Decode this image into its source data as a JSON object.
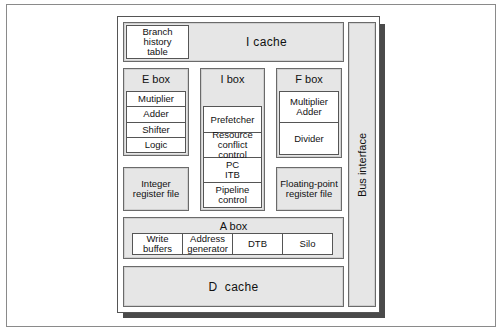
{
  "diagram": {
    "i_cache": {
      "label": "I cache",
      "branch_history_table": "Branch\nhistory\ntable"
    },
    "e_box": {
      "title": "E  box",
      "units": [
        "Mutiplier",
        "Adder",
        "Shifter",
        "Logic"
      ]
    },
    "i_box": {
      "title": "I  box",
      "units": [
        "Prefetcher",
        "Resource conflict control",
        "PC ITB",
        "Pipeline control"
      ]
    },
    "f_box": {
      "title": "F  box",
      "units": [
        "Multiplier Adder",
        "Divider"
      ]
    },
    "integer_register_file": "Integer register file",
    "floating_point_register_file": "Floating-point register file",
    "a_box": {
      "title": "A  box",
      "units": [
        "Write buffers",
        "Address generator",
        "DTB",
        "Silo"
      ]
    },
    "d_cache": {
      "label": "D  cache"
    },
    "bus_interface": {
      "label": "Bus interface"
    },
    "colors": {
      "block_fill": "#e6e6e6",
      "unit_fill": "#ffffff",
      "border": "#555555",
      "shadow": "#4a4a4a"
    }
  }
}
